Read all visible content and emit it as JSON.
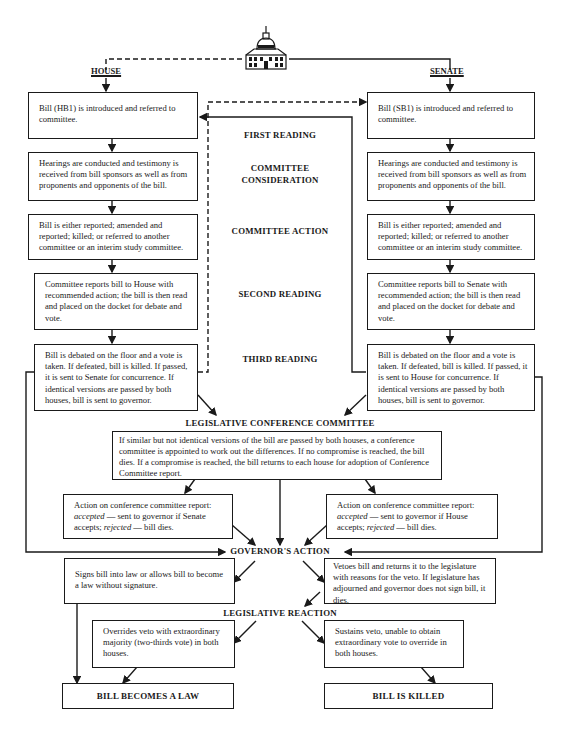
{
  "headers": {
    "house": "HOUSE",
    "senate": "SENATE"
  },
  "icons": {
    "capitol": "capitol-building-icon"
  },
  "stages": {
    "first_reading": "FIRST READING",
    "committee_consideration_1": "COMMITTEE",
    "committee_consideration_2": "CONSIDERATION",
    "committee_action": "COMMITTEE ACTION",
    "second_reading": "SECOND READING",
    "third_reading": "THIRD READING",
    "conference_committee": "LEGISLATIVE CONFERENCE COMMITTEE",
    "governors_action": "GOVERNOR'S ACTION",
    "legislative_reaction": "LEGISLATIVE REACTION"
  },
  "house": {
    "introduce": "Bill (HB1) is introduced and referred to committee.",
    "hearings": "Hearings are conducted and testimony is received from bill sponsors as well as from proponents and opponents of the bill.",
    "action": "Bill is either reported; amended and reported; killed; or referred to another committee or an interim study committee.",
    "report": "Committee reports bill to House with recommended action; the bill is then read and placed on the docket for debate and vote.",
    "debate": "Bill is debated on the floor and a vote is taken. If defeated, bill is killed. If passed, it is sent to Senate for concurrence. If identical versions are passed by both houses, bill is sent to governor."
  },
  "senate": {
    "introduce": "Bill (SB1) is introduced and referred to committee.",
    "hearings": "Hearings are conducted and testimony is received from bill sponsors as well as from proponents and opponents of the bill.",
    "action": "Bill is either reported; amended and reported; killed; or referred to another committee or an interim study committee.",
    "report": "Committee reports bill to Senate with recommended action; the bill is then read and placed on the docket for debate and vote.",
    "debate": "Bill is debated on the floor and a vote is taken. If defeated, bill is killed. If passed, it is sent to House for concurrence. If identical versions are passed by both houses, bill is sent to governor."
  },
  "conference": {
    "text": "If similar but not identical versions of the bill are passed by both houses, a conference committee is appointed to work out the differences. If no compromise is reached, the bill dies. If a compromise is reached, the bill returns to each house for adoption of Conference Committee report.",
    "left": {
      "intro": "Action on conference committee report:",
      "accepted": "accepted",
      "accepted_text": " — sent to governor if Senate accepts; ",
      "rejected": "rejected",
      "rejected_text": " — bill dies."
    },
    "right": {
      "intro": "Action on conference committee report:",
      "accepted": "accepted",
      "accepted_text": " — sent to governor if House accepts; ",
      "rejected": "rejected",
      "rejected_text": " — bill dies."
    }
  },
  "governor": {
    "signs": "Signs bill into law or allows bill to become a law without signature.",
    "vetoes": "Vetoes bill and returns it to the legislature with reasons for the veto. If legislature has adjourned and governor does not sign bill, it dies."
  },
  "reaction": {
    "overrides": "Overrides veto with extraordinary majority (two-thirds vote) in both houses.",
    "sustains": "Sustains veto, unable to obtain extraordinary vote to override in both houses."
  },
  "outcomes": {
    "law": "BILL BECOMES A LAW",
    "killed": "BILL IS KILLED"
  }
}
